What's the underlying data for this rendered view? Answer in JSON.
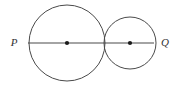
{
  "figure": {
    "background_color": "#ffffff",
    "stroke_color": "#4a4a4a",
    "dot_color": "#1a1a1a",
    "label_color": "#333333",
    "width": 179,
    "height": 86,
    "labels": {
      "left_point": "P",
      "right_point": "Q"
    },
    "shapes": {
      "large_circle": {
        "name": "large-circle",
        "center_x": 67,
        "center_y": 43,
        "radius": 38
      },
      "small_circle": {
        "name": "small-circle",
        "center_x": 130,
        "center_y": 43,
        "radius": 26
      },
      "segment": {
        "name": "diameter-segment",
        "x1": 28,
        "y1": 43,
        "x2": 154,
        "y2": 43
      },
      "large_center_dot": {
        "name": "large-circle-center-dot",
        "cx": 67,
        "cy": 43,
        "r": 2.1
      },
      "small_center_dot": {
        "name": "small-circle-center-dot",
        "cx": 130,
        "cy": 43,
        "r": 2.1
      },
      "left_label_pos": {
        "x": 14,
        "y": 43
      },
      "right_label_pos": {
        "x": 165,
        "y": 43
      }
    }
  }
}
